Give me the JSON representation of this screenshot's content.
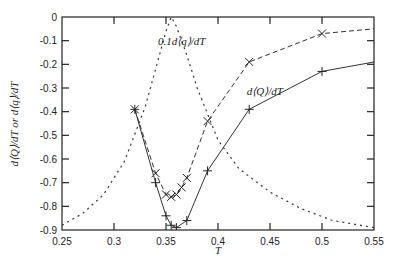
{
  "chart_data": {
    "type": "line",
    "title": "",
    "xlabel": "T",
    "ylabel": "d⟨Q⟩/dT or d⟨q⟩/dT",
    "xlim": [
      0.25,
      0.55
    ],
    "ylim": [
      -0.9,
      0
    ],
    "xticks": [
      0.25,
      0.3,
      0.35,
      0.4,
      0.45,
      0.5,
      0.55
    ],
    "xtick_labels": [
      "0.25",
      "0.3",
      "0.35",
      "0.4",
      "0.45",
      "0.5",
      "0.55"
    ],
    "yticks": [
      0,
      -0.1,
      -0.2,
      -0.3,
      -0.4,
      -0.5,
      -0.6,
      -0.7,
      -0.8,
      -0.9
    ],
    "ytick_labels": [
      "0",
      "-0.1",
      "-0.2",
      "-0.3",
      "-0.4",
      "-0.5",
      "-0.6",
      "-0.7",
      "-0.8",
      "-0.9"
    ],
    "grid": false,
    "legend": "inline annotations",
    "series": [
      {
        "name": "0.1d⟨q⟩/dT",
        "style": "dashed",
        "marker": "x",
        "x": [
          0.32,
          0.34,
          0.35,
          0.355,
          0.36,
          0.365,
          0.37,
          0.39,
          0.43,
          0.5,
          0.55
        ],
        "y": [
          -0.39,
          -0.66,
          -0.75,
          -0.76,
          -0.75,
          -0.72,
          -0.68,
          -0.44,
          -0.19,
          -0.07,
          -0.05
        ],
        "marker_mask": [
          1,
          1,
          1,
          1,
          1,
          1,
          1,
          1,
          1,
          1,
          0
        ]
      },
      {
        "name": "d⟨Q⟩/dT",
        "style": "solid",
        "marker": "+",
        "x": [
          0.32,
          0.34,
          0.35,
          0.355,
          0.36,
          0.37,
          0.39,
          0.43,
          0.5,
          0.55
        ],
        "y": [
          -0.39,
          -0.7,
          -0.84,
          -0.88,
          -0.89,
          -0.86,
          -0.65,
          -0.39,
          -0.23,
          -0.19
        ],
        "marker_mask": [
          1,
          1,
          1,
          1,
          1,
          1,
          1,
          1,
          1,
          0
        ]
      },
      {
        "name": "reference curve",
        "style": "dotted",
        "marker": "none",
        "x": [
          0.25,
          0.27,
          0.29,
          0.31,
          0.33,
          0.34,
          0.35,
          0.355,
          0.36,
          0.37,
          0.38,
          0.4,
          0.42,
          0.45,
          0.48,
          0.51,
          0.55
        ],
        "y": [
          -0.88,
          -0.83,
          -0.75,
          -0.61,
          -0.38,
          -0.22,
          -0.06,
          0.0,
          -0.04,
          -0.16,
          -0.3,
          -0.52,
          -0.64,
          -0.74,
          -0.81,
          -0.86,
          -0.89
        ]
      }
    ],
    "annotations": [
      {
        "text": "0.1d⟨q⟩/dT",
        "x": 0.365,
        "y": -0.12
      },
      {
        "text": "d⟨Q⟩/dT",
        "x": 0.445,
        "y": -0.33
      }
    ]
  }
}
